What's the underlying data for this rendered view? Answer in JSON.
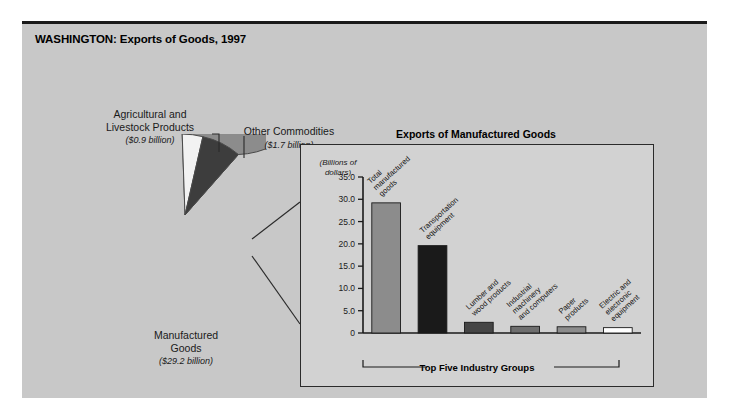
{
  "page_title": "WASHINGTON: Exports of Goods, 1997",
  "colors": {
    "figure_background": "#c8c8c8",
    "inset_background": "#d2d2d2",
    "frame": "#1a1a1a",
    "pie_manufactured": "#8c8c8c",
    "pie_agricultural": "#f2f2f2",
    "pie_other": "#3d3d3d",
    "bar_total": "#8c8c8c",
    "bar_transportation": "#1a1a1a",
    "bar_lumber": "#454545",
    "bar_machinery": "#6e6e6e",
    "bar_paper": "#8c8c8c",
    "bar_electric": "#ffffff"
  },
  "pie": {
    "slices": [
      {
        "name": "Agricultural and Livestock Products",
        "label_line1": "Agricultural and",
        "label_line2": "Livestock Products",
        "amount_label": "($0.9 billion)",
        "value": 0.9,
        "color": "#f2f2f2"
      },
      {
        "name": "Other Commodities",
        "label_line1": "Other Commodities",
        "label_line2": "",
        "amount_label": "($1.7 billion)",
        "value": 1.7,
        "color": "#3d3d3d"
      },
      {
        "name": "Manufactured Goods",
        "label_line1": "Manufactured",
        "label_line2": "Goods",
        "amount_label": "($29.2 billion)",
        "value": 29.2,
        "color": "#8c8c8c"
      }
    ]
  },
  "inset": {
    "title": "Exports of Manufactured Goods",
    "units_line1": "(Billions of",
    "units_line2": "dollars)",
    "bracket_label": "Top Five Industry Groups"
  },
  "chart_data": {
    "type": "bar",
    "title": "Exports of Manufactured Goods",
    "xlabel": "Top Five Industry Groups",
    "ylabel": "(Billions of dollars)",
    "ylim": [
      0,
      35
    ],
    "ytick_labels": [
      "35.0",
      "30.0",
      "25.0",
      "20.0",
      "15.0",
      "10.0",
      "5.0",
      "0"
    ],
    "ytick_values": [
      35,
      30,
      25,
      20,
      15,
      10,
      5,
      0
    ],
    "grid": false,
    "legend": "none",
    "categories": [
      "Total manufactured goods",
      "Transportation equipment",
      "Lumber and wood products",
      "Industrial machinery and computers",
      "Paper products",
      "Electric and electronic equipment"
    ],
    "category_lines": [
      [
        "Total",
        "manufactured",
        "goods"
      ],
      [
        "Transportation",
        "equipment"
      ],
      [
        "Lumber and",
        "wood products"
      ],
      [
        "Industrial",
        "machinery",
        "and computers"
      ],
      [
        "Paper",
        "products"
      ],
      [
        "Electric and",
        "electronic",
        "equipment"
      ]
    ],
    "values": [
      29.2,
      19.6,
      2.4,
      1.5,
      1.4,
      1.2
    ],
    "bar_colors": [
      "#8c8c8c",
      "#1a1a1a",
      "#454545",
      "#6e6e6e",
      "#8c8c8c",
      "#ffffff"
    ]
  },
  "pie_chart_data": {
    "type": "pie",
    "title": "WASHINGTON: Exports of Goods, 1997",
    "labels": [
      "Manufactured Goods",
      "Other Commodities",
      "Agricultural and Livestock Products"
    ],
    "values": [
      29.2,
      1.7,
      0.9
    ],
    "unit": "billions of dollars"
  }
}
